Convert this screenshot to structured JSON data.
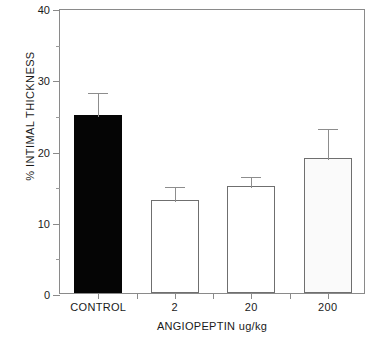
{
  "chart_data": {
    "type": "bar",
    "title": "",
    "xlabel": "ANGIOPEPTIN ug/kg",
    "ylabel": "% INTIMAL THICKNESS",
    "categories": [
      "CONTROL",
      "2",
      "20",
      "200"
    ],
    "values": [
      25,
      13,
      15,
      19
    ],
    "errors_upper": [
      3.3,
      2.2,
      1.5,
      4.3
    ],
    "error_tops": [
      28.3,
      15.2,
      16.5,
      23.3
    ],
    "bar_styles": [
      "solid-black",
      "open-white",
      "open-white",
      "stippled"
    ],
    "ylim": [
      0,
      40
    ],
    "yticks": [
      0,
      10,
      20,
      30,
      40
    ],
    "ytick_labels": [
      "0",
      "10",
      "20",
      "30",
      "40"
    ],
    "yticks_minor": [
      5,
      15,
      25,
      35
    ],
    "grid": false,
    "legend": "none",
    "frame": "box"
  },
  "axes": {
    "y_label": "% INTIMAL THICKNESS",
    "x_label": "ANGIOPEPTIN ug/kg",
    "y_tick_0": "0",
    "y_tick_10": "10",
    "y_tick_20": "20",
    "y_tick_30": "30",
    "y_tick_40": "40",
    "x_tick_0": "CONTROL",
    "x_tick_1": "2",
    "x_tick_2": "20",
    "x_tick_3": "200"
  },
  "colors": {
    "background": "#ffffff",
    "axis": "#8a8a8a",
    "text": "#1a1a1a",
    "bar_solid": "#050505",
    "bar_open_fill": "#ffffff",
    "bar_open_edge": "#6f6f6f",
    "bar_stipple_fill": "#fafafa",
    "error_bar": "#8d8d8d"
  }
}
